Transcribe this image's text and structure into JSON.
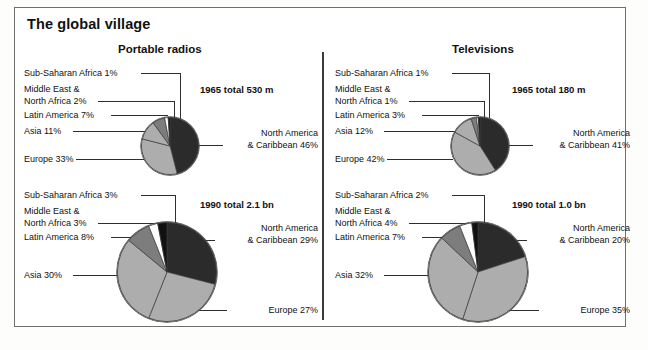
{
  "page": {
    "title": "The global village"
  },
  "colors": {
    "north_america": "#2b2b2b",
    "europe": "#adadad",
    "asia": "#adadad",
    "latin_america": "#7d7d7d",
    "middle_east": "#ffffff",
    "sub_saharan": "#111111",
    "stroke": "#3a3a3a",
    "text": "#111111",
    "frame": "#6f6f6f"
  },
  "panels": [
    {
      "id": "portable-radios",
      "title": "Portable radios",
      "charts": [
        {
          "id": "radios-1965",
          "total_note": "1965 total 530 m",
          "labels": {
            "sub_saharan": "Sub-Saharan Africa 1%",
            "middle_east_line1": "Middle East &",
            "middle_east_line2": "North Africa 2%",
            "latin_america": "Latin America 7%",
            "asia": "Asia 11%",
            "europe": "Europe 33%",
            "north_america_line1": "North America",
            "north_america_line2": "& Caribbean 46%"
          }
        },
        {
          "id": "radios-1990",
          "total_note": "1990 total 2.1 bn",
          "labels": {
            "sub_saharan": "Sub-Saharan Africa 3%",
            "middle_east_line1": "Middle East &",
            "middle_east_line2": "North Africa 3%",
            "latin_america": "Latin America 8%",
            "asia": "Asia 30%",
            "europe": "Europe 27%",
            "north_america_line1": "North America",
            "north_america_line2": "& Caribbean 29%"
          }
        }
      ]
    },
    {
      "id": "televisions",
      "title": "Televisions",
      "charts": [
        {
          "id": "tv-1965",
          "total_note": "1965 total 180 m",
          "labels": {
            "sub_saharan": "Sub-Saharan Africa 1%",
            "middle_east_line1": "Middle East &",
            "middle_east_line2": "North Africa 1%",
            "latin_america": "Latin America 3%",
            "asia": "Asia 12%",
            "europe": "Europe 42%",
            "north_america_line1": "North America",
            "north_america_line2": "& Caribbean 41%"
          }
        },
        {
          "id": "tv-1990",
          "total_note": "1990 total 1.0 bn",
          "labels": {
            "sub_saharan": "Sub-Saharan Africa 2%",
            "middle_east_line1": "Middle East &",
            "middle_east_line2": "North Africa 4%",
            "latin_america": "Latin America 7%",
            "asia": "Asia 32%",
            "europe": "Europe 35%",
            "north_america_line1": "North America",
            "north_america_line2": "& Caribbean 20%"
          }
        }
      ]
    }
  ],
  "chart_data": [
    {
      "type": "pie",
      "id": "radios-1965",
      "title": "Portable radios",
      "subtitle": "1965 total 530 m",
      "total": "530 m",
      "year": 1965,
      "unit": "percent",
      "categories": [
        "North America & Caribbean",
        "Europe",
        "Asia",
        "Latin America",
        "Middle East & North Africa",
        "Sub-Saharan Africa"
      ],
      "values": [
        46,
        33,
        11,
        7,
        2,
        1
      ],
      "slice_colors": [
        "#2b2b2b",
        "#adadad",
        "#adadad",
        "#7d7d7d",
        "#ffffff",
        "#111111"
      ],
      "start_angle_deg": 0,
      "direction": "clockwise",
      "legend": "callout-labels"
    },
    {
      "type": "pie",
      "id": "radios-1990",
      "title": "Portable radios",
      "subtitle": "1990 total 2.1 bn",
      "total": "2.1 bn",
      "year": 1990,
      "unit": "percent",
      "categories": [
        "North America & Caribbean",
        "Europe",
        "Asia",
        "Latin America",
        "Middle East & North Africa",
        "Sub-Saharan Africa"
      ],
      "values": [
        29,
        27,
        30,
        8,
        3,
        3
      ],
      "slice_colors": [
        "#2b2b2b",
        "#adadad",
        "#adadad",
        "#7d7d7d",
        "#ffffff",
        "#111111"
      ],
      "start_angle_deg": 0,
      "direction": "clockwise",
      "legend": "callout-labels"
    },
    {
      "type": "pie",
      "id": "tv-1965",
      "title": "Televisions",
      "subtitle": "1965 total 180 m",
      "total": "180 m",
      "year": 1965,
      "unit": "percent",
      "categories": [
        "North America & Caribbean",
        "Europe",
        "Asia",
        "Latin America",
        "Middle East & North Africa",
        "Sub-Saharan Africa"
      ],
      "values": [
        41,
        42,
        12,
        3,
        1,
        1
      ],
      "slice_colors": [
        "#2b2b2b",
        "#adadad",
        "#adadad",
        "#7d7d7d",
        "#ffffff",
        "#111111"
      ],
      "start_angle_deg": 0,
      "direction": "clockwise",
      "legend": "callout-labels"
    },
    {
      "type": "pie",
      "id": "tv-1990",
      "title": "Televisions",
      "subtitle": "1990 total 1.0 bn",
      "total": "1.0 bn",
      "year": 1990,
      "unit": "percent",
      "categories": [
        "North America & Caribbean",
        "Europe",
        "Asia",
        "Latin America",
        "Middle East & North Africa",
        "Sub-Saharan Africa"
      ],
      "values": [
        20,
        35,
        32,
        7,
        4,
        2
      ],
      "slice_colors": [
        "#2b2b2b",
        "#adadad",
        "#adadad",
        "#7d7d7d",
        "#ffffff",
        "#111111"
      ],
      "start_angle_deg": 0,
      "direction": "clockwise",
      "legend": "callout-labels"
    }
  ]
}
